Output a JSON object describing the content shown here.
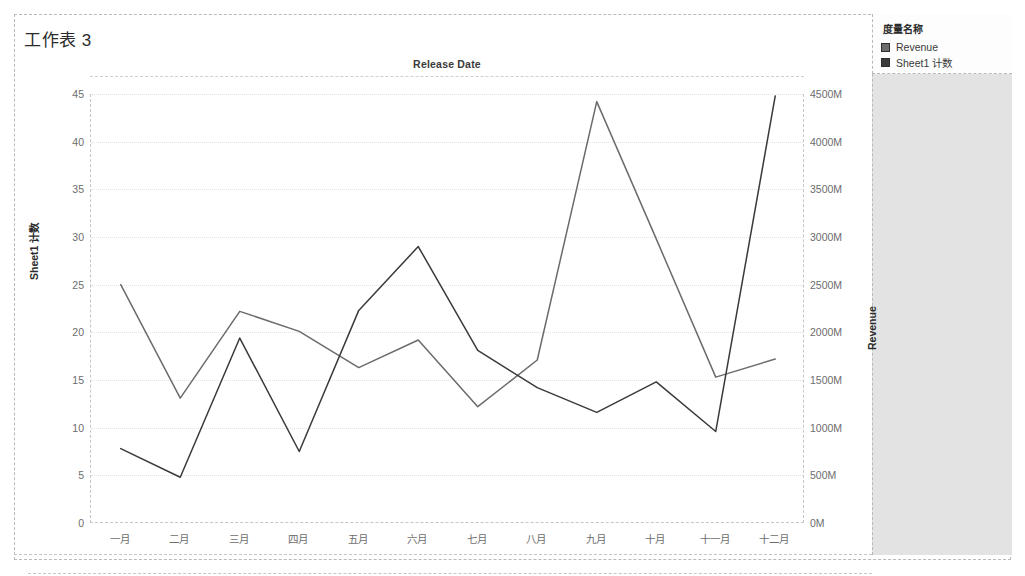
{
  "worksheet": {
    "title": "工作表 3"
  },
  "legend": {
    "title": "度量名称",
    "items": [
      {
        "label": "Revenue",
        "color": "#6b6b6b"
      },
      {
        "label": "Sheet1 计数",
        "color": "#3a3a3a"
      }
    ]
  },
  "chart_data": {
    "type": "line",
    "title": "Release Date",
    "xlabel": "",
    "categories": [
      "一月",
      "二月",
      "三月",
      "四月",
      "五月",
      "六月",
      "七月",
      "八月",
      "九月",
      "十月",
      "十一月",
      "十二月"
    ],
    "grid": true,
    "legend_position": "right",
    "axes": {
      "left": {
        "label": "Sheet1 计数",
        "ticks": [
          0,
          5,
          10,
          15,
          20,
          25,
          30,
          35,
          40,
          45
        ],
        "tick_labels": [
          "0",
          "5",
          "10",
          "15",
          "20",
          "25",
          "30",
          "35",
          "40",
          "45"
        ],
        "ylim": [
          0,
          45
        ]
      },
      "right": {
        "label": "Revenue",
        "ticks": [
          0,
          500,
          1000,
          1500,
          2000,
          2500,
          3000,
          3500,
          4000,
          4500
        ],
        "tick_labels": [
          "0M",
          "500M",
          "1000M",
          "1500M",
          "2000M",
          "2500M",
          "3000M",
          "3500M",
          "4000M",
          "4500M"
        ],
        "ylim": [
          0,
          4500
        ],
        "unit": "M"
      }
    },
    "series": [
      {
        "name": "Revenue",
        "axis": "right",
        "color": "#6b6b6b",
        "values_axis_units": [
          25.0,
          13.1,
          22.2,
          20.1,
          16.3,
          19.2,
          12.2,
          17.1,
          44.2,
          29.8,
          15.3,
          17.2
        ],
        "values": [
          2500,
          1310,
          2220,
          2010,
          1630,
          1920,
          1220,
          1710,
          4420,
          2980,
          1530,
          1720
        ]
      },
      {
        "name": "Sheet1 计数",
        "axis": "left",
        "color": "#3a3a3a",
        "values": [
          7.8,
          4.8,
          19.4,
          7.5,
          22.3,
          29.0,
          18.1,
          14.2,
          11.6,
          14.8,
          9.6,
          44.8
        ]
      }
    ]
  }
}
